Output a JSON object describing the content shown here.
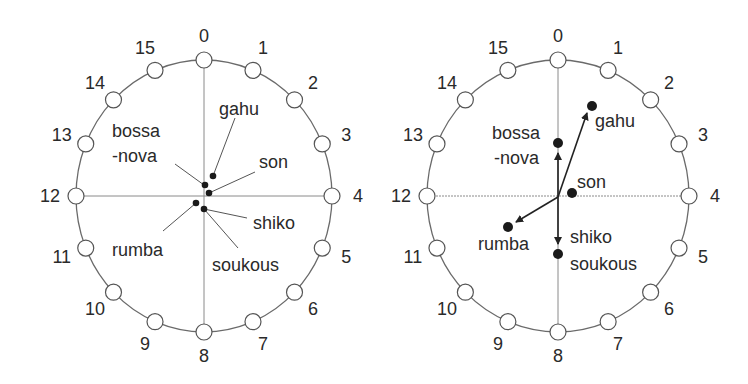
{
  "diagram": {
    "positions": [
      "0",
      "1",
      "2",
      "3",
      "4",
      "5",
      "6",
      "7",
      "8",
      "9",
      "10",
      "11",
      "12",
      "13",
      "14",
      "15"
    ],
    "left_panel": {
      "rhythms": [
        {
          "name": "gahu",
          "label": "gahu"
        },
        {
          "name": "bossa-nova",
          "label_line1": "bossa",
          "label_line2": "-nova"
        },
        {
          "name": "son",
          "label": "son"
        },
        {
          "name": "shiko",
          "label": "shiko"
        },
        {
          "name": "rumba",
          "label": "rumba"
        },
        {
          "name": "soukous",
          "label": "soukous"
        }
      ]
    },
    "right_panel": {
      "rhythms": [
        {
          "name": "gahu",
          "label": "gahu"
        },
        {
          "name": "bossa-nova",
          "label_line1": "bossa",
          "label_line2": "-nova"
        },
        {
          "name": "son",
          "label": "son"
        },
        {
          "name": "rumba",
          "label": "rumba"
        },
        {
          "name": "shiko-soukous",
          "label_line1": "shiko",
          "label_line2": "soukous"
        }
      ]
    }
  },
  "colors": {
    "ring": "#6a6a6a",
    "dot": "#1a1a1a",
    "text": "#2a2a2a"
  }
}
